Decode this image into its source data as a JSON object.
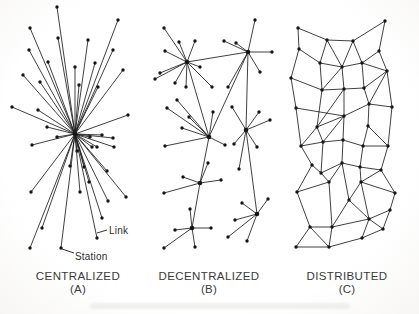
{
  "figure": {
    "ink": "#1d1d1d",
    "dot_color": "#151515",
    "line_width": 0.85,
    "node_radius": 1.7,
    "hub_radius": 2.3,
    "panels": [
      {
        "id": "centralized",
        "caption": "CENTRALIZED",
        "sub": "(A)",
        "type": "star",
        "hub": [
          75,
          134
        ],
        "nodes": [
          [
            57,
            7
          ],
          [
            118,
            20
          ],
          [
            30,
            28
          ],
          [
            58,
            38
          ],
          [
            88,
            40
          ],
          [
            29,
            50
          ],
          [
            113,
            50
          ],
          [
            48,
            62
          ],
          [
            95,
            63
          ],
          [
            75,
            67
          ],
          [
            123,
            70
          ],
          [
            23,
            75
          ],
          [
            40,
            82
          ],
          [
            79,
            85
          ],
          [
            98,
            87
          ],
          [
            12,
            107
          ],
          [
            38,
            110
          ],
          [
            128,
            115
          ],
          [
            47,
            127
          ],
          [
            57,
            137
          ],
          [
            90,
            137
          ],
          [
            102,
            135
          ],
          [
            113,
            138
          ],
          [
            97,
            147
          ],
          [
            77,
            151
          ],
          [
            70,
            166
          ],
          [
            84,
            167
          ],
          [
            32,
            145
          ],
          [
            92,
            147
          ],
          [
            114,
            147
          ],
          [
            107,
            171
          ],
          [
            89,
            182
          ],
          [
            31,
            192
          ],
          [
            80,
            192
          ],
          [
            126,
            197
          ],
          [
            108,
            201
          ],
          [
            102,
            218
          ],
          [
            42,
            228
          ],
          [
            97,
            238
          ],
          [
            30,
            248
          ],
          [
            61,
            248
          ]
        ]
      },
      {
        "id": "decentralized",
        "caption": "DECENTRALIZED",
        "sub": "(B)",
        "type": "graph",
        "hubs": [
          0,
          1,
          2,
          3,
          4,
          5,
          6
        ],
        "nodes": [
          [
            187,
            62
          ],
          [
            248,
            52
          ],
          [
            209,
            137
          ],
          [
            246,
            130
          ],
          [
            200,
            183
          ],
          [
            192,
            228
          ],
          [
            257,
            214
          ],
          [
            164,
            28
          ],
          [
            179,
            42
          ],
          [
            195,
            41
          ],
          [
            165,
            51
          ],
          [
            160,
            73
          ],
          [
            155,
            79
          ],
          [
            175,
            83
          ],
          [
            186,
            87
          ],
          [
            200,
            67
          ],
          [
            212,
            87
          ],
          [
            255,
            20
          ],
          [
            236,
            43
          ],
          [
            224,
            41
          ],
          [
            260,
            72
          ],
          [
            272,
            52
          ],
          [
            228,
            87
          ],
          [
            177,
            100
          ],
          [
            167,
            108
          ],
          [
            189,
            117
          ],
          [
            213,
            112
          ],
          [
            182,
            128
          ],
          [
            165,
            146
          ],
          [
            225,
            145
          ],
          [
            232,
            107
          ],
          [
            259,
            112
          ],
          [
            270,
            120
          ],
          [
            234,
            144
          ],
          [
            257,
            147
          ],
          [
            239,
            169
          ],
          [
            183,
            177
          ],
          [
            221,
            180
          ],
          [
            164,
            193
          ],
          [
            208,
            163
          ],
          [
            190,
            209
          ],
          [
            175,
            230
          ],
          [
            211,
            228
          ],
          [
            164,
            248
          ],
          [
            195,
            247
          ],
          [
            242,
            203
          ],
          [
            268,
            199
          ],
          [
            235,
            220
          ],
          [
            228,
            237
          ],
          [
            247,
            241
          ]
        ],
        "edges": [
          [
            0,
            7
          ],
          [
            0,
            8
          ],
          [
            0,
            9
          ],
          [
            0,
            10
          ],
          [
            0,
            11
          ],
          [
            0,
            12
          ],
          [
            0,
            13
          ],
          [
            0,
            14
          ],
          [
            0,
            15
          ],
          [
            0,
            16
          ],
          [
            1,
            17
          ],
          [
            1,
            18
          ],
          [
            1,
            19
          ],
          [
            1,
            20
          ],
          [
            1,
            21
          ],
          [
            1,
            22
          ],
          [
            2,
            23
          ],
          [
            2,
            24
          ],
          [
            2,
            25
          ],
          [
            2,
            26
          ],
          [
            2,
            27
          ],
          [
            2,
            28
          ],
          [
            2,
            29
          ],
          [
            3,
            30
          ],
          [
            3,
            31
          ],
          [
            3,
            32
          ],
          [
            3,
            33
          ],
          [
            3,
            34
          ],
          [
            3,
            35
          ],
          [
            4,
            36
          ],
          [
            4,
            37
          ],
          [
            4,
            38
          ],
          [
            4,
            39
          ],
          [
            5,
            40
          ],
          [
            5,
            41
          ],
          [
            5,
            42
          ],
          [
            5,
            43
          ],
          [
            5,
            44
          ],
          [
            6,
            45
          ],
          [
            6,
            46
          ],
          [
            6,
            47
          ],
          [
            6,
            48
          ],
          [
            6,
            49
          ],
          [
            0,
            1
          ],
          [
            0,
            2
          ],
          [
            1,
            2
          ],
          [
            1,
            3
          ],
          [
            3,
            6
          ],
          [
            2,
            4
          ],
          [
            4,
            5
          ]
        ]
      },
      {
        "id": "distributed",
        "caption": "DISTRIBUTED",
        "sub": "(C)",
        "type": "graph",
        "hubs": [],
        "nodes": [
          [
            298,
            28
          ],
          [
            327,
            40
          ],
          [
            353,
            41
          ],
          [
            385,
            21
          ],
          [
            299,
            49
          ],
          [
            320,
            63
          ],
          [
            342,
            67
          ],
          [
            362,
            63
          ],
          [
            379,
            51
          ],
          [
            291,
            78
          ],
          [
            322,
            90
          ],
          [
            344,
            89
          ],
          [
            364,
            88
          ],
          [
            387,
            71
          ],
          [
            296,
            108
          ],
          [
            317,
            127
          ],
          [
            344,
            116
          ],
          [
            369,
            104
          ],
          [
            392,
            107
          ],
          [
            301,
            146
          ],
          [
            323,
            142
          ],
          [
            343,
            140
          ],
          [
            363,
            146
          ],
          [
            368,
            126
          ],
          [
            388,
            146
          ],
          [
            312,
            165
          ],
          [
            321,
            173
          ],
          [
            342,
            163
          ],
          [
            360,
            167
          ],
          [
            381,
            170
          ],
          [
            297,
            192
          ],
          [
            329,
            182
          ],
          [
            349,
            200
          ],
          [
            361,
            182
          ],
          [
            395,
            193
          ],
          [
            310,
            227
          ],
          [
            332,
            227
          ],
          [
            369,
            219
          ],
          [
            390,
            210
          ],
          [
            296,
            247
          ],
          [
            329,
            247
          ],
          [
            362,
            238
          ],
          [
            383,
            229
          ]
        ],
        "edges": [
          [
            0,
            1
          ],
          [
            1,
            2
          ],
          [
            2,
            3
          ],
          [
            0,
            4
          ],
          [
            1,
            5
          ],
          [
            1,
            6
          ],
          [
            2,
            6
          ],
          [
            2,
            7
          ],
          [
            3,
            8
          ],
          [
            4,
            5
          ],
          [
            5,
            6
          ],
          [
            6,
            7
          ],
          [
            7,
            8
          ],
          [
            4,
            9
          ],
          [
            5,
            10
          ],
          [
            6,
            10
          ],
          [
            6,
            11
          ],
          [
            7,
            12
          ],
          [
            7,
            13
          ],
          [
            8,
            13
          ],
          [
            9,
            10
          ],
          [
            10,
            11
          ],
          [
            11,
            12
          ],
          [
            12,
            13
          ],
          [
            9,
            14
          ],
          [
            10,
            15
          ],
          [
            11,
            15
          ],
          [
            11,
            16
          ],
          [
            12,
            17
          ],
          [
            13,
            17
          ],
          [
            13,
            18
          ],
          [
            14,
            16
          ],
          [
            15,
            16
          ],
          [
            16,
            17
          ],
          [
            17,
            18
          ],
          [
            14,
            19
          ],
          [
            15,
            19
          ],
          [
            15,
            20
          ],
          [
            16,
            20
          ],
          [
            16,
            21
          ],
          [
            17,
            23
          ],
          [
            18,
            24
          ],
          [
            23,
            24
          ],
          [
            19,
            20
          ],
          [
            20,
            21
          ],
          [
            21,
            22
          ],
          [
            22,
            23
          ],
          [
            22,
            24
          ],
          [
            19,
            25
          ],
          [
            20,
            26
          ],
          [
            21,
            27
          ],
          [
            22,
            28
          ],
          [
            24,
            29
          ],
          [
            25,
            26
          ],
          [
            26,
            27
          ],
          [
            27,
            28
          ],
          [
            28,
            29
          ],
          [
            25,
            30
          ],
          [
            26,
            31
          ],
          [
            27,
            31
          ],
          [
            27,
            32
          ],
          [
            28,
            33
          ],
          [
            29,
            33
          ],
          [
            29,
            34
          ],
          [
            30,
            31
          ],
          [
            32,
            33
          ],
          [
            33,
            34
          ],
          [
            30,
            35
          ],
          [
            31,
            36
          ],
          [
            32,
            36
          ],
          [
            32,
            37
          ],
          [
            33,
            37
          ],
          [
            34,
            38
          ],
          [
            35,
            36
          ],
          [
            36,
            37
          ],
          [
            37,
            38
          ],
          [
            35,
            39
          ],
          [
            35,
            40
          ],
          [
            36,
            40
          ],
          [
            37,
            41
          ],
          [
            37,
            42
          ],
          [
            38,
            42
          ],
          [
            39,
            40
          ],
          [
            40,
            41
          ],
          [
            41,
            42
          ]
        ]
      }
    ],
    "annotations": [
      {
        "text": "Link",
        "leader": [
          [
            107,
            230
          ],
          [
            97,
            233
          ]
        ]
      },
      {
        "text": "Station",
        "leader": [
          [
            74,
            253
          ],
          [
            62,
            249
          ]
        ]
      }
    ]
  }
}
